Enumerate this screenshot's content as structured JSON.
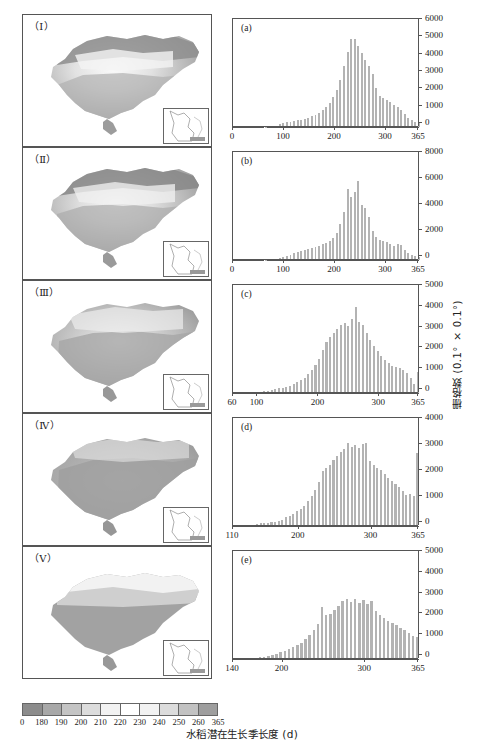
{
  "figure": {
    "xlabel_cn": "水稻潜在生长季长度 (d)",
    "ylabel_cn": "栅格数 (0.1° × 0.1°)"
  },
  "colorbar": {
    "name": "rice-growing-season-length-colorbar",
    "ticks": [
      "0",
      "180",
      "190",
      "200",
      "210",
      "220",
      "230",
      "240",
      "250",
      "260",
      "365"
    ],
    "colors": [
      "#8c8c8c",
      "#a8a8a8",
      "#c4c4c4",
      "#dcdcdc",
      "#f2f2f2",
      "#ffffff",
      "#f2f2f2",
      "#dcdcdc",
      "#c2c2c2",
      "#9e9e9e"
    ]
  },
  "maps": [
    {
      "label": "（Ⅰ）",
      "name": "map-panel-1"
    },
    {
      "label": "（Ⅱ）",
      "name": "map-panel-2"
    },
    {
      "label": "（Ⅲ）",
      "name": "map-panel-3"
    },
    {
      "label": "（Ⅳ）",
      "name": "map-panel-4"
    },
    {
      "label": "（Ⅴ）",
      "name": "map-panel-5"
    }
  ],
  "chart_data": [
    {
      "type": "bar",
      "panel": "(a)",
      "title": "",
      "xlabel": "水稻潜在生长季长度 (d)",
      "ylabel": "栅格数 (0.1° × 0.1°)",
      "xlim": [
        0,
        365
      ],
      "ylim": [
        0,
        6000
      ],
      "xticks": [
        0,
        100,
        200,
        300,
        365
      ],
      "xtick_labels": [
        "0",
        "100",
        "200",
        "300",
        "365"
      ],
      "yticks": [
        0,
        1000,
        2000,
        3000,
        4000,
        5000,
        6000
      ],
      "ytick_labels": [
        "0",
        "1000",
        "2000",
        "3000",
        "4000",
        "5000",
        "6000"
      ],
      "grid": false,
      "bin_width": 7,
      "x": [
        60,
        67,
        74,
        81,
        88,
        95,
        102,
        109,
        116,
        123,
        130,
        137,
        144,
        151,
        158,
        165,
        172,
        179,
        186,
        193,
        200,
        207,
        214,
        221,
        228,
        235,
        242,
        249,
        256,
        263,
        270,
        277,
        284,
        291,
        298,
        305,
        312,
        319,
        326,
        333,
        340,
        347,
        354,
        361
      ],
      "values": [
        20,
        30,
        45,
        70,
        160,
        240,
        270,
        300,
        330,
        380,
        420,
        470,
        530,
        620,
        700,
        820,
        980,
        1130,
        1400,
        1750,
        2150,
        2700,
        3500,
        4350,
        5050,
        5050,
        4700,
        4250,
        3850,
        3500,
        3050,
        2250,
        1800,
        1650,
        1550,
        1450,
        1250,
        1150,
        1000,
        750,
        500,
        380,
        300,
        250
      ]
    },
    {
      "type": "bar",
      "panel": "(b)",
      "title": "",
      "xlabel": "水稻潜在生长季长度 (d)",
      "ylabel": "栅格数 (0.1° × 0.1°)",
      "xlim": [
        0,
        365
      ],
      "ylim": [
        0,
        8000
      ],
      "xticks": [
        0,
        100,
        200,
        300,
        365
      ],
      "xtick_labels": [
        "0",
        "100",
        "200",
        "300",
        "365"
      ],
      "yticks": [
        0,
        2000,
        4000,
        6000,
        8000
      ],
      "ytick_labels": [
        "0",
        "2000",
        "4000",
        "6000",
        "8000"
      ],
      "grid": false,
      "bin_width": 7,
      "x": [
        60,
        67,
        74,
        81,
        88,
        95,
        102,
        109,
        116,
        123,
        130,
        137,
        144,
        151,
        158,
        165,
        172,
        179,
        186,
        193,
        200,
        207,
        214,
        221,
        228,
        235,
        242,
        249,
        256,
        263,
        270,
        277,
        284,
        291,
        298,
        305,
        312,
        319,
        326,
        333,
        340,
        347,
        354,
        361
      ],
      "values": [
        30,
        50,
        80,
        110,
        160,
        220,
        300,
        380,
        520,
        620,
        700,
        760,
        820,
        900,
        1000,
        1100,
        1200,
        1300,
        1500,
        1700,
        2100,
        2800,
        3700,
        5500,
        4850,
        5200,
        6100,
        4200,
        4000,
        3300,
        2200,
        1750,
        1550,
        1450,
        1350,
        1200,
        1100,
        1250,
        1150,
        800,
        560,
        420,
        300,
        250
      ]
    },
    {
      "type": "bar",
      "panel": "(c)",
      "title": "",
      "xlabel": "水稻潜在生长季长度 (d)",
      "ylabel": "栅格数 (0.1° × 0.1°)",
      "xlim": [
        60,
        365
      ],
      "ylim": [
        0,
        5000
      ],
      "xticks": [
        60,
        100,
        200,
        300,
        365
      ],
      "xtick_labels": [
        "60",
        "100",
        "200",
        "300",
        "365"
      ],
      "yticks": [
        0,
        1000,
        2000,
        3000,
        4000,
        5000
      ],
      "ytick_labels": [
        "0",
        "1000",
        "2000",
        "3000",
        "4000",
        "5000"
      ],
      "grid": false,
      "bin_width": 6,
      "x": [
        96,
        102,
        108,
        114,
        120,
        126,
        132,
        138,
        144,
        150,
        156,
        162,
        168,
        174,
        180,
        186,
        192,
        198,
        204,
        210,
        216,
        222,
        228,
        234,
        240,
        246,
        252,
        258,
        264,
        270,
        276,
        282,
        288,
        294,
        300,
        306,
        312,
        318,
        324,
        330,
        336,
        342,
        348,
        354,
        360
      ],
      "values": [
        40,
        60,
        90,
        110,
        140,
        180,
        220,
        260,
        300,
        360,
        430,
        520,
        620,
        740,
        900,
        1100,
        1350,
        1650,
        2050,
        2450,
        2700,
        2900,
        3100,
        3250,
        3350,
        3200,
        3550,
        4150,
        3400,
        3250,
        2900,
        2550,
        2250,
        2000,
        1800,
        1600,
        1450,
        1300,
        1250,
        1200,
        1100,
        950,
        700,
        420,
        1000
      ]
    },
    {
      "type": "bar",
      "panel": "(d)",
      "title": "",
      "xlabel": "水稻潜在生长季长度 (d)",
      "ylabel": "栅格数 (0.1° × 0.1°)",
      "xlim": [
        110,
        365
      ],
      "ylim": [
        0,
        4000
      ],
      "xticks": [
        110,
        200,
        300,
        365
      ],
      "xtick_labels": [
        "110",
        "200",
        "300",
        "365"
      ],
      "yticks": [
        0,
        1000,
        2000,
        3000,
        4000
      ],
      "ytick_labels": [
        "0",
        "1000",
        "2000",
        "3000",
        "4000"
      ],
      "grid": false,
      "bin_width": 5,
      "x": [
        140,
        145,
        150,
        155,
        160,
        165,
        170,
        175,
        180,
        185,
        190,
        195,
        200,
        205,
        210,
        215,
        220,
        225,
        230,
        235,
        240,
        245,
        250,
        255,
        260,
        265,
        270,
        275,
        280,
        285,
        290,
        295,
        300,
        305,
        310,
        315,
        320,
        325,
        330,
        335,
        340,
        345,
        350,
        355,
        360
      ],
      "values": [
        80,
        100,
        120,
        130,
        140,
        160,
        200,
        250,
        330,
        400,
        480,
        560,
        650,
        780,
        950,
        1150,
        1400,
        1700,
        2100,
        2250,
        2350,
        2550,
        2700,
        2850,
        2950,
        3200,
        3050,
        3100,
        3000,
        3150,
        3200,
        2500,
        2350,
        2250,
        2150,
        2000,
        1850,
        1750,
        1600,
        1500,
        1350,
        1200,
        1250,
        1150,
        2800
      ]
    },
    {
      "type": "bar",
      "panel": "(e)",
      "title": "",
      "xlabel": "水稻潜在生长季长度 (d)",
      "ylabel": "栅格数 (0.1° × 0.1°)",
      "xlim": [
        140,
        365
      ],
      "ylim": [
        0,
        5000
      ],
      "xticks": [
        140,
        200,
        300,
        365
      ],
      "xtick_labels": [
        "140",
        "200",
        "300",
        "365"
      ],
      "yticks": [
        0,
        1000,
        2000,
        3000,
        4000,
        5000
      ],
      "ytick_labels": [
        "0",
        "1000",
        "2000",
        "3000",
        "4000",
        "5000"
      ],
      "grid": false,
      "bin_width": 5,
      "x": [
        165,
        170,
        175,
        180,
        185,
        190,
        195,
        200,
        205,
        210,
        215,
        220,
        225,
        230,
        235,
        240,
        245,
        250,
        255,
        260,
        265,
        270,
        275,
        280,
        285,
        290,
        295,
        300,
        305,
        310,
        315,
        320,
        325,
        330,
        335,
        340,
        345,
        350,
        355,
        360
      ],
      "values": [
        60,
        90,
        120,
        160,
        200,
        250,
        320,
        400,
        480,
        560,
        650,
        780,
        950,
        1150,
        1400,
        1700,
        2500,
        2100,
        2150,
        2350,
        2550,
        2800,
        2900,
        2750,
        2900,
        2700,
        2850,
        2650,
        2800,
        2300,
        2100,
        1950,
        1850,
        1750,
        1650,
        1500,
        1400,
        1250,
        1100,
        1050
      ]
    }
  ]
}
